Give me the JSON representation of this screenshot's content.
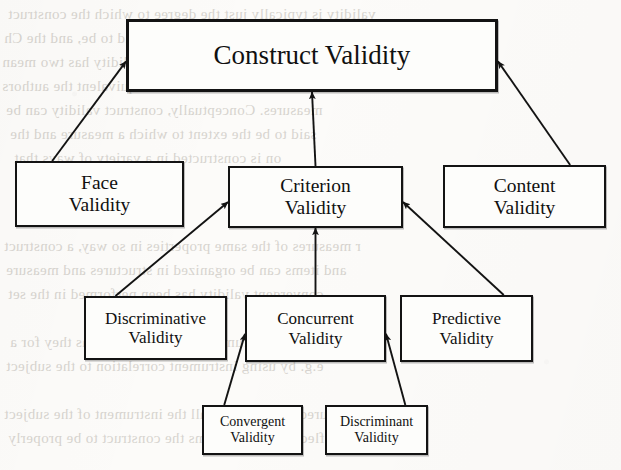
{
  "diagram": {
    "colors": {
      "paper": "#fcfbf9",
      "box_fill": "#fdfdfb",
      "ink": "#131313",
      "bleed_text": "#b9b4ad"
    },
    "nodes": [
      {
        "id": "construct-validity",
        "level": 1,
        "line1": "Construct Validity",
        "line2": "",
        "x": 126,
        "y": 19,
        "w": 372,
        "h": 73
      },
      {
        "id": "face-validity",
        "level": 2,
        "line1": "Face",
        "line2": "Validity",
        "x": 15,
        "y": 161,
        "w": 169,
        "h": 66
      },
      {
        "id": "criterion-validity",
        "level": 2,
        "line1": "Criterion",
        "line2": "Validity",
        "x": 228,
        "y": 166,
        "w": 175,
        "h": 62
      },
      {
        "id": "content-validity",
        "level": 2,
        "line1": "Content",
        "line2": "Validity",
        "x": 443,
        "y": 165,
        "w": 163,
        "h": 63
      },
      {
        "id": "discriminative-validity",
        "level": 3,
        "line1": "Discriminative",
        "line2": "Validity",
        "x": 84,
        "y": 296,
        "w": 143,
        "h": 64
      },
      {
        "id": "concurrent-validity",
        "level": 3,
        "line1": "Concurrent",
        "line2": "Validity",
        "x": 245,
        "y": 295,
        "w": 141,
        "h": 67
      },
      {
        "id": "predictive-validity",
        "level": 3,
        "line1": "Predictive",
        "line2": "Validity",
        "x": 400,
        "y": 295,
        "w": 133,
        "h": 67
      },
      {
        "id": "convergent-validity",
        "level": 4,
        "line1": "Convergent",
        "line2": "Validity",
        "x": 202,
        "y": 405,
        "w": 101,
        "h": 50
      },
      {
        "id": "discriminant-validity",
        "level": 4,
        "line1": "Discriminant",
        "line2": "Validity",
        "x": 325,
        "y": 405,
        "w": 103,
        "h": 50
      }
    ],
    "edges": [
      {
        "id": "face-to-construct",
        "from": "face-validity",
        "to": "construct-validity",
        "style": "diagonal",
        "arrow": "up-right"
      },
      {
        "id": "criterion-to-construct",
        "from": "criterion-validity",
        "to": "construct-validity",
        "style": "vertical",
        "arrow": "up"
      },
      {
        "id": "content-to-construct",
        "from": "content-validity",
        "to": "construct-validity",
        "style": "diagonal",
        "arrow": "up-left"
      },
      {
        "id": "discriminative-to-criterion",
        "from": "discriminative-validity",
        "to": "criterion-validity",
        "style": "diagonal",
        "arrow": "up-right"
      },
      {
        "id": "concurrent-to-criterion",
        "from": "concurrent-validity",
        "to": "criterion-validity",
        "style": "vertical",
        "arrow": "up"
      },
      {
        "id": "predictive-to-criterion",
        "from": "predictive-validity",
        "to": "criterion-validity",
        "style": "diagonal",
        "arrow": "up-left"
      },
      {
        "id": "convergent-to-concurrent",
        "from": "convergent-validity",
        "to": "concurrent-validity",
        "style": "diagonal",
        "arrow": "up-right"
      },
      {
        "id": "discriminant-to-concurrent",
        "from": "discriminant-validity",
        "to": "concurrent-validity",
        "style": "diagonal",
        "arrow": "up-left"
      }
    ],
    "bleed_text": [
      {
        "text": "validity is typically just the degree to which the construct",
        "x": 8,
        "y": 6,
        "size": 15
      },
      {
        "text": "a component of the instrument is said to be, and the Ch",
        "x": 4,
        "y": 30,
        "size": 15
      },
      {
        "text": "e. Viewed in this way, construct validity has two mean",
        "x": 2,
        "y": 54,
        "size": 15
      },
      {
        "text": "on duties and subnetworks with equivalent the authors",
        "x": 2,
        "y": 78,
        "size": 15
      },
      {
        "text": "measures. Conceptually, construct validity can be",
        "x": 6,
        "y": 102,
        "size": 15
      },
      {
        "text": "said to be the extent to which a measure and the",
        "x": 10,
        "y": 126,
        "size": 15
      },
      {
        "text": "on is constructed in a variety of ways that",
        "x": 14,
        "y": 150,
        "size": 15
      },
      {
        "text": "r measures of the same properties in so way, a construct",
        "x": 4,
        "y": 238,
        "size": 15
      },
      {
        "text": "and items can be organized in structures and measure",
        "x": 6,
        "y": 262,
        "size": 15
      },
      {
        "text": "convergent validity has been performed in the set",
        "x": 8,
        "y": 286,
        "size": 15
      },
      {
        "text": "which instruments of the construct as they for a",
        "x": 10,
        "y": 334,
        "size": 15
      },
      {
        "text": "e.g. by using instrument correlation to the subject",
        "x": 6,
        "y": 358,
        "size": 15
      },
      {
        "text": "measured differently in all the instrument of the subject",
        "x": 4,
        "y": 406,
        "size": 15
      },
      {
        "text": "may reflect individual items the construct to be properly",
        "x": 8,
        "y": 430,
        "size": 15
      }
    ]
  }
}
